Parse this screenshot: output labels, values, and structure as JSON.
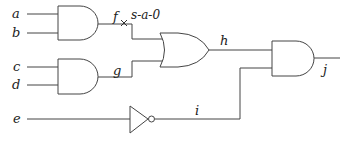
{
  "diagram": {
    "type": "logic-circuit",
    "inputs": [
      {
        "id": "a",
        "label": "a"
      },
      {
        "id": "b",
        "label": "b"
      },
      {
        "id": "c",
        "label": "c"
      },
      {
        "id": "d",
        "label": "d"
      },
      {
        "id": "e",
        "label": "e"
      }
    ],
    "gates": [
      {
        "id": "and1",
        "type": "AND",
        "inputs": [
          "a",
          "b"
        ],
        "output": "f"
      },
      {
        "id": "and2",
        "type": "AND",
        "inputs": [
          "c",
          "d"
        ],
        "output": "g"
      },
      {
        "id": "or1",
        "type": "OR",
        "inputs": [
          "f",
          "g"
        ],
        "output": "h"
      },
      {
        "id": "not1",
        "type": "NOT",
        "inputs": [
          "e"
        ],
        "output": "i"
      },
      {
        "id": "and3",
        "type": "AND",
        "inputs": [
          "h",
          "i"
        ],
        "output": "j"
      }
    ],
    "nets": {
      "f": "f",
      "g": "g",
      "h": "h",
      "i": "i",
      "j": "j"
    },
    "fault": {
      "net": "f",
      "label": "s-a-0",
      "marker": "x-mark"
    }
  }
}
